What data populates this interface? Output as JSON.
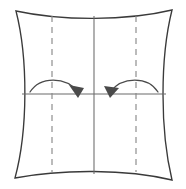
{
  "diagram": {
    "background_color": "#ffffff",
    "outline": {
      "name": "curved-square-sheet",
      "stroke_color": "#3a3a3a",
      "fill_color": "#ffffff",
      "stroke_width": 1.35,
      "corners": [
        {
          "label": "top-left",
          "x": 16,
          "y": 11
        },
        {
          "label": "top-right",
          "x": 172,
          "y": 10
        },
        {
          "label": "bottom-right",
          "x": 172,
          "y": 180
        },
        {
          "label": "bottom-left",
          "x": 15,
          "y": 178
        }
      ],
      "edge_curvature": "concave inward on all four sides",
      "path": "M 16 11 C 62 21, 126 21, 172 10 C 160 58, 160 130, 172 180 C 126 169, 62 169, 15 178 C 28 130, 28 58, 16 11 Z"
    },
    "creases": [
      {
        "name": "vertical-center-crease",
        "style": "solid",
        "color": "#6a6a6a",
        "orientation": "vertical",
        "x": 94,
        "path": "M 94 16 L 94 174"
      },
      {
        "name": "horizontal-center-crease",
        "style": "solid",
        "color": "#6a6a6a",
        "orientation": "horizontal",
        "y": 94,
        "path": "M 22 94 L 166 94"
      },
      {
        "name": "left-quarter-fold-line",
        "style": "dashed",
        "color": "#8a8a8a",
        "orientation": "vertical",
        "x": 52,
        "path": "M 52 16 L 52 172"
      },
      {
        "name": "right-quarter-fold-line",
        "style": "dashed",
        "color": "#8a8a8a",
        "orientation": "vertical",
        "x": 136,
        "path": "M 136 16 L 136 172"
      }
    ],
    "arrows": [
      {
        "name": "left-fold-arrow",
        "direction": "left-edge-folds-right-to-center",
        "color": "#4a4a4a",
        "arc_path": "M 30 92 C 40 76, 66 76, 78 92",
        "head_points": "78 98, 69 85, 84 88",
        "tip": {
          "x": 78,
          "y": 97
        }
      },
      {
        "name": "right-fold-arrow",
        "direction": "right-edge-folds-left-to-center",
        "color": "#4a4a4a",
        "arc_path": "M 158 92 C 148 76, 122 76, 110 92",
        "head_points": "110 98, 104 86, 119 88",
        "tip": {
          "x": 110,
          "y": 97
        }
      }
    ]
  }
}
